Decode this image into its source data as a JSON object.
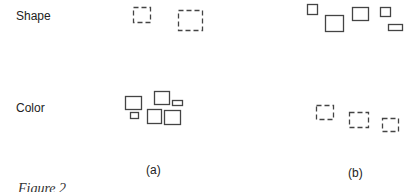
{
  "figure": {
    "rows": [
      {
        "label": "Shape"
      },
      {
        "label": "Color"
      }
    ],
    "panels": [
      {
        "label": "(a)"
      },
      {
        "label": "(b)"
      }
    ],
    "caption": "Figure 2"
  },
  "colors": {
    "stroke": "#444444",
    "text": "#222222"
  },
  "shapes": {
    "shape_a": [
      {
        "x": 133,
        "y": 7,
        "w": 17,
        "h": 15,
        "style": "dashed"
      },
      {
        "x": 178,
        "y": 10,
        "w": 24,
        "h": 20,
        "style": "dashed"
      }
    ],
    "shape_b": [
      {
        "x": 307,
        "y": 4,
        "w": 10,
        "h": 10,
        "style": "solid"
      },
      {
        "x": 325,
        "y": 15,
        "w": 18,
        "h": 16,
        "style": "solid"
      },
      {
        "x": 352,
        "y": 7,
        "w": 16,
        "h": 13,
        "style": "solid"
      },
      {
        "x": 380,
        "y": 7,
        "w": 10,
        "h": 9,
        "style": "solid"
      },
      {
        "x": 388,
        "y": 24,
        "w": 14,
        "h": 6,
        "style": "solid"
      }
    ],
    "color_a": [
      {
        "x": 125,
        "y": 96,
        "w": 16,
        "h": 13,
        "style": "solid"
      },
      {
        "x": 130,
        "y": 112,
        "w": 8,
        "h": 6,
        "style": "solid"
      },
      {
        "x": 147,
        "y": 109,
        "w": 14,
        "h": 14,
        "style": "solid"
      },
      {
        "x": 154,
        "y": 91,
        "w": 15,
        "h": 13,
        "style": "solid"
      },
      {
        "x": 172,
        "y": 100,
        "w": 10,
        "h": 5,
        "style": "solid"
      },
      {
        "x": 164,
        "y": 110,
        "w": 16,
        "h": 14,
        "style": "solid"
      }
    ],
    "color_b": [
      {
        "x": 316,
        "y": 105,
        "w": 17,
        "h": 14,
        "style": "dashed"
      },
      {
        "x": 349,
        "y": 112,
        "w": 19,
        "h": 15,
        "style": "dashed"
      },
      {
        "x": 382,
        "y": 118,
        "w": 16,
        "h": 13,
        "style": "dashed"
      }
    ]
  }
}
